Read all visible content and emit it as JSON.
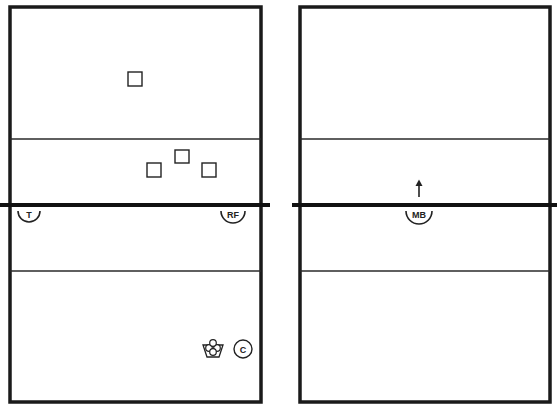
{
  "diagram": {
    "type": "volleyball-drill-court-diagram",
    "colors": {
      "line": "#1a1a1a",
      "background": "#ffffff"
    },
    "courts": [
      {
        "id": "left",
        "players": [
          {
            "label": "T",
            "x": 28,
            "y": 216
          },
          {
            "label": "RF",
            "x": 232,
            "y": 216
          }
        ],
        "targets": [
          {
            "x": 135,
            "y": 79
          },
          {
            "x": 182,
            "y": 156
          },
          {
            "x": 154,
            "y": 170
          },
          {
            "x": 209,
            "y": 170
          }
        ],
        "equipment": {
          "ball_cart": {
            "x": 213,
            "y": 349
          },
          "coach": {
            "label": "C",
            "x": 243,
            "y": 349
          }
        }
      },
      {
        "id": "right",
        "players": [
          {
            "label": "MB",
            "x": 418,
            "y": 216
          }
        ],
        "arrows": [
          {
            "x": 418,
            "from_y": 197,
            "to_y": 180
          }
        ]
      }
    ]
  }
}
